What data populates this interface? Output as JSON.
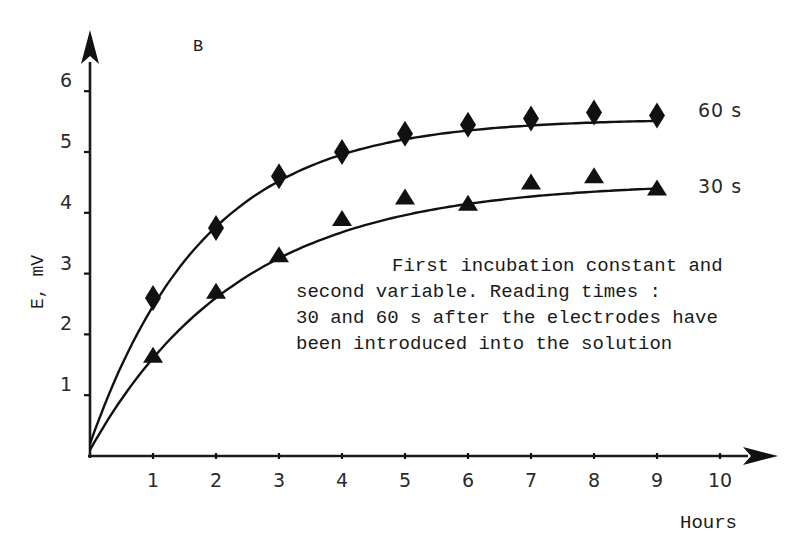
{
  "chart_data": {
    "type": "line",
    "panel_label": "B",
    "title": "",
    "xlabel": "Hours",
    "ylabel": "E, mV",
    "xlim": [
      0,
      10.5
    ],
    "ylim": [
      0,
      6.5
    ],
    "x_ticks": [
      1,
      2,
      3,
      4,
      5,
      6,
      7,
      8,
      9,
      10
    ],
    "y_ticks": [
      1,
      2,
      3,
      4,
      5,
      6
    ],
    "grid": false,
    "legend": "inline labels at curve ends",
    "x": [
      1,
      2,
      3,
      4,
      5,
      6,
      7,
      8,
      9
    ],
    "series": [
      {
        "name": "60 s",
        "marker": "diamond",
        "values": [
          2.6,
          3.75,
          4.6,
          5.0,
          5.3,
          5.45,
          5.55,
          5.65,
          5.6
        ],
        "fit_curve": {
          "model": "exponential_saturation",
          "asymptote": 5.55,
          "rate": 0.55,
          "start": [
            0,
            0.2
          ]
        }
      },
      {
        "name": "30 s",
        "marker": "triangle",
        "values": [
          1.65,
          2.7,
          3.3,
          3.9,
          4.25,
          4.15,
          4.5,
          4.6,
          4.4
        ],
        "fit_curve": {
          "model": "exponential_saturation",
          "asymptote": 4.5,
          "rate": 0.42,
          "start": [
            0,
            0.1
          ]
        }
      }
    ],
    "annotation": [
      "First incubation constant and",
      "second variable. Reading times :",
      "30 and 60 s after the electrodes have",
      "been introduced into the solution"
    ]
  }
}
